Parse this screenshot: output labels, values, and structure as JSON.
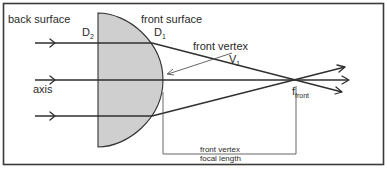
{
  "diagram": {
    "colors": {
      "background": "#ffffff",
      "frame": "#3a3a3a",
      "lens_fill": "#cfcfcf",
      "lens_stroke": "#333333",
      "ray": "#2f2f2f",
      "text": "#2a2a2a"
    },
    "labels": {
      "back_surface": "back surface",
      "back_surface_symbol": "D",
      "back_surface_sub": "2",
      "front_surface": "front surface",
      "front_surface_symbol": "D",
      "front_surface_sub": "1",
      "front_vertex": "front vertex",
      "vertex_symbol": "V",
      "vertex_sub": "1",
      "axis": "axis",
      "focal_symbol": "f",
      "focal_sub": "front",
      "dimension_line1": "front vertex",
      "dimension_line2": "focal length"
    },
    "elements": {
      "lens": "plano-convex lens",
      "incoming_rays": 3,
      "outgoing_rays": 3,
      "optical_axis": "horizontal axis",
      "focal_point": "f_front",
      "dimension_bracket": "front vertex focal length"
    }
  }
}
